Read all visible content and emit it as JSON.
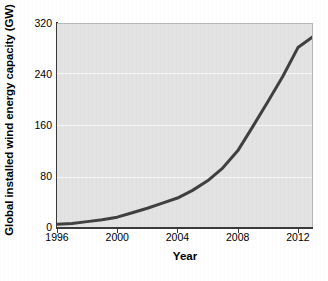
{
  "chart_data": {
    "type": "line",
    "title": "",
    "xlabel": "Year",
    "ylabel": "Global installed wind energy capacity (GW)",
    "xlim": [
      1996,
      2013
    ],
    "ylim": [
      0,
      320
    ],
    "xticks": [
      1996,
      2000,
      2004,
      2008,
      2012
    ],
    "xtick_labels": [
      "1996",
      "2000",
      "2004",
      "2008",
      "2012"
    ],
    "yticks": [
      0,
      80,
      160,
      240,
      320
    ],
    "ytick_labels": [
      "0",
      "80",
      "160",
      "240",
      "320"
    ],
    "grid": "horizontal",
    "legend": "none",
    "series": [
      {
        "name": "Global installed wind energy capacity",
        "color": "#404040",
        "line_width": 3,
        "x": [
          1996,
          1997,
          1998,
          1999,
          2000,
          2001,
          2002,
          2003,
          2004,
          2005,
          2006,
          2007,
          2008,
          2009,
          2010,
          2011,
          2012,
          2013
        ],
        "values": [
          6,
          7,
          10,
          13,
          17,
          24,
          31,
          39,
          47,
          59,
          74,
          94,
          121,
          159,
          198,
          238,
          283,
          300
        ]
      }
    ],
    "annotations": []
  },
  "axes": {
    "y_axis_title": "Global installed wind energy capacity (GW)",
    "x_axis_title": "Year"
  },
  "style": {
    "plot_background": "#e3e3e3",
    "figure_background": "#ffffff",
    "gridline_color": "#f7f7f7",
    "axis_color": "#3a3a3a",
    "line_color": "#404040"
  }
}
